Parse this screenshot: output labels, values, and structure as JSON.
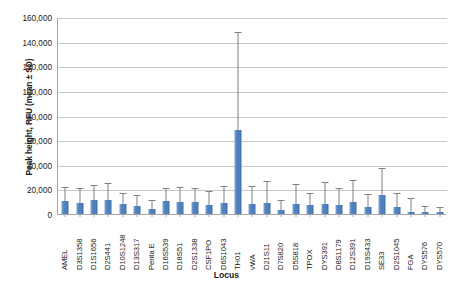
{
  "chart_data": {
    "type": "bar",
    "title": "",
    "xlabel": "Locus",
    "ylabel": "Peak height, RFU (mean ± SD)",
    "ylim": [
      0,
      160000
    ],
    "ytick_labels": [
      "160,000",
      "140,000",
      "120,000",
      "100,000",
      "80,000",
      "60,000",
      "40,000",
      "20,000",
      "0"
    ],
    "ytick_values": [
      160000,
      140000,
      120000,
      100000,
      80000,
      60000,
      40000,
      20000,
      0
    ],
    "grid": true,
    "legend": "none",
    "bar_color": "#4E81BD",
    "errorbar_color": "#808080",
    "categories": [
      "AMEL",
      "D3S1358",
      "D1S1656",
      "D2S441",
      "D10S1248",
      "D13S317",
      "Penta E",
      "D16S539",
      "D18S51",
      "D2S1338",
      "CSF1PO",
      "D6S1043",
      "TH01",
      "vWA",
      "D21S11",
      "D7S820",
      "D5S818",
      "TPOX",
      "DYS391",
      "D8S1179",
      "D12S391",
      "D19S433",
      "SE33",
      "D2S1045",
      "FGA",
      "DYS576",
      "DYS570"
    ],
    "values": [
      10500,
      9200,
      11000,
      11000,
      7800,
      6500,
      4300,
      10200,
      10000,
      9400,
      7500,
      9200,
      68000,
      8200,
      8900,
      3400,
      8400,
      7000,
      7900,
      7100,
      9400,
      5500,
      15200,
      5500,
      2000,
      1700,
      1500
    ],
    "errors": [
      11000,
      11000,
      12000,
      13500,
      8500,
      8500,
      6500,
      10500,
      11500,
      11000,
      10000,
      13000,
      79000,
      13500,
      17500,
      7500,
      15500,
      9500,
      17500,
      13000,
      17500,
      10000,
      21000,
      10500,
      10500,
      4000,
      3500
    ],
    "series": [
      {
        "name": "Peak height, RFU (mean ± SD)",
        "values": [
          10500,
          9200,
          11000,
          11000,
          7800,
          6500,
          4300,
          10200,
          10000,
          9400,
          7500,
          9200,
          68000,
          8200,
          8900,
          3400,
          8400,
          7000,
          7900,
          7100,
          9400,
          5500,
          15200,
          5500,
          2000,
          1700,
          1500
        ]
      }
    ]
  }
}
